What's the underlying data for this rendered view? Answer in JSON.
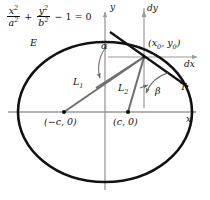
{
  "figure": {
    "width": 210,
    "height": 200,
    "background": "#ffffff"
  },
  "colors": {
    "curve": "#111111",
    "axis": "#9a9a9a",
    "focal_line": "#6e6e6e",
    "tangent": "#111111",
    "normal": "#555555",
    "text": "#111111",
    "angle_arc": "#6e6e6e"
  },
  "equation": {
    "numerator_x": "x",
    "numerator_x_exp": "2",
    "denominator_a": "a",
    "denominator_a_exp": "2",
    "plus": "+",
    "numerator_y": "y",
    "numerator_y_exp": "2",
    "denominator_b": "b",
    "denominator_b_exp": "2",
    "tail": "− 1 = 0"
  },
  "labels": {
    "ellipse": "E",
    "axis_x": "x",
    "axis_y": "y",
    "diff_x": "dx",
    "diff_y": "dy",
    "tangent": "T",
    "focal_radius_1": "L",
    "focal_radius_1_sub": "1",
    "focal_radius_2": "L",
    "focal_radius_2_sub": "2",
    "angle_alpha": "α",
    "angle_beta": "β",
    "point_open": "(",
    "point_x0": "x",
    "point_x0_sub": "0",
    "point_comma": ", ",
    "point_y0": "y",
    "point_y0_sub": "0",
    "point_close": ")",
    "focus_left": "(−c, 0)",
    "focus_right": "(c, 0)"
  },
  "geometry": {
    "center": {
      "x": 105,
      "y": 112
    },
    "ellipse_rx": 87,
    "ellipse_ry": 70,
    "focus_left_point": {
      "x": 64,
      "y": 112
    },
    "focus_right_point": {
      "x": 128,
      "y": 112
    },
    "tangent_point": {
      "x": 144,
      "y": 57
    },
    "x_axis_y": 112,
    "y_axis_x": 105
  }
}
